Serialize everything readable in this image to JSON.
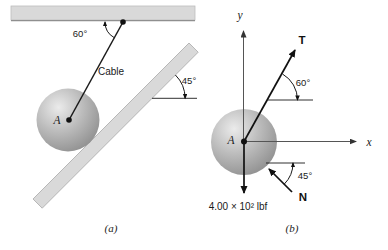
{
  "figure": {
    "panel_a": {
      "caption": "(a)",
      "cable_label": "Cable",
      "cable_angle": "60°",
      "incline_angle": "45°",
      "point_label": "A"
    },
    "panel_b": {
      "caption": "(b)",
      "axis_y_label": "y",
      "axis_x_label": "x",
      "tension_label": "T",
      "tension_angle": "60°",
      "normal_label": "N",
      "normal_angle": "45°",
      "point_label": "A",
      "weight_label": "4.00 × 10² lbf"
    },
    "colors": {
      "bar_fill": "#d9d9d9",
      "bar_edge": "#aaaaaa",
      "bar_shadow_edge": "#8f8f8f",
      "line": "#1a1a1a",
      "axis": "#555555",
      "sphere_highlight": "#ebebeb",
      "sphere_mid": "#bdbdbd",
      "sphere_dark": "#8e8e8e"
    }
  }
}
